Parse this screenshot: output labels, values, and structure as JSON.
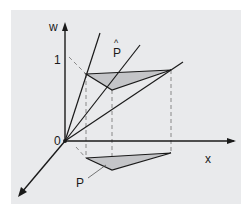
{
  "figure": {
    "axes": {
      "w_label": "w",
      "x_label": "x",
      "origin_label": "0",
      "tick_label": "1"
    },
    "labels": {
      "projected_triangle": "P",
      "lifted_triangle_hat": "^",
      "lifted_triangle": "P"
    },
    "colors": {
      "background": "#e9eaec",
      "line": "#1a1a1a",
      "fill": "#c4c5c8",
      "dashed": "#888888"
    }
  }
}
